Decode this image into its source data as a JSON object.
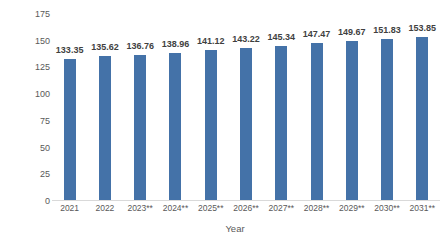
{
  "chart_data": {
    "type": "bar",
    "title": "",
    "xlabel": "Year",
    "ylabel": "Consumption in metric kilotons",
    "categories": [
      "2021",
      "2022",
      "2023**",
      "2024**",
      "2025**",
      "2026**",
      "2027**",
      "2028**",
      "2029**",
      "2030**",
      "2031**"
    ],
    "values": [
      133.35,
      135.62,
      136.76,
      138.96,
      141.12,
      143.22,
      145.34,
      147.47,
      149.67,
      151.83,
      153.85
    ],
    "value_labels": [
      "133.35",
      "135.62",
      "136.76",
      "138.96",
      "141.12",
      "143.22",
      "145.34",
      "147.47",
      "149.67",
      "151.83",
      "153.85"
    ],
    "ylim": [
      0,
      175
    ],
    "yticks": [
      0,
      25,
      50,
      75,
      100,
      125,
      150,
      175
    ],
    "ytick_labels": [
      "0",
      "25",
      "50",
      "75",
      "100",
      "125",
      "150",
      "175"
    ],
    "grid": false,
    "legend": "none",
    "bar_color": "#4472a8",
    "axis_text_color": "#595959",
    "label_text_color": "#3f3f3f",
    "background": "#ffffff"
  }
}
